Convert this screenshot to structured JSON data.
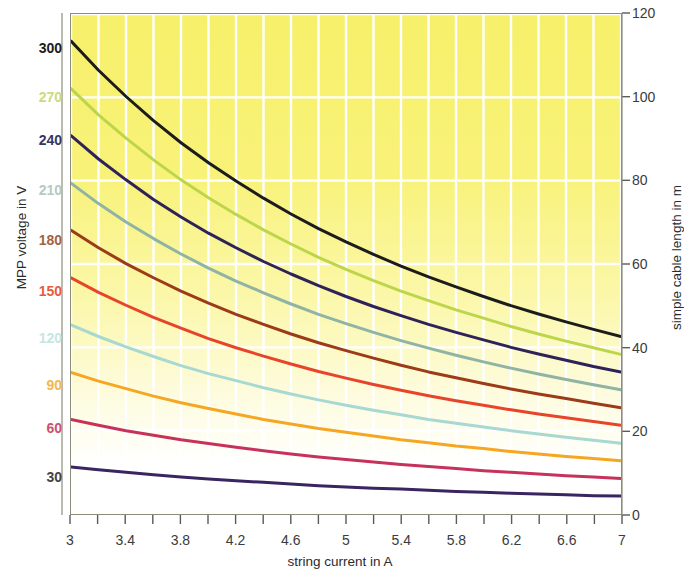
{
  "chart_data": {
    "type": "line",
    "title": "",
    "xlabel": "string current in A",
    "ylabel_left": "MPP voltage in V",
    "ylabel_right": "simple cable length in m",
    "xlim": [
      3,
      7
    ],
    "ylim_right": [
      0,
      120
    ],
    "x_ticks": [
      3,
      3.2,
      3.4,
      3.6,
      3.8,
      4.0,
      4.2,
      4.4,
      4.6,
      4.8,
      5.0,
      5.2,
      5.4,
      5.6,
      5.8,
      6.0,
      6.2,
      6.4,
      6.6,
      6.8,
      7.0
    ],
    "x_tick_labels": [
      "3",
      "",
      "3.4",
      "",
      "3.8",
      "",
      "4.2",
      "",
      "4.6",
      "",
      "5",
      "",
      "5.4",
      "",
      "5.8",
      "",
      "6.2",
      "",
      "6.6",
      "",
      "7"
    ],
    "y_right_ticks": [
      0,
      20,
      40,
      60,
      80,
      100,
      120
    ],
    "y_right_tick_labels": [
      "0",
      "20",
      "40",
      "60",
      "80",
      "100",
      "120"
    ],
    "y_left_tick_labels": [
      "300",
      "270",
      "240",
      "210",
      "180",
      "150",
      "120",
      "90",
      "60",
      "30"
    ],
    "grid": true,
    "grid_color": "#ffffff",
    "legend_position": "none",
    "background_gradient": [
      "#f7f06a",
      "#ffffff"
    ],
    "series": [
      {
        "name": "300",
        "label": "300",
        "mpp_voltage_V": 300,
        "color": "#1c1c1c",
        "cable_length_m": [
          113.5,
          106.5,
          100.2,
          94.4,
          89.1,
          84.3,
          79.9,
          75.8,
          72.0,
          68.5,
          65.3,
          62.3,
          59.5,
          56.9,
          54.5,
          52.2,
          50.0,
          48.0,
          46.1,
          44.3,
          42.6
        ]
      },
      {
        "name": "270",
        "label": "270",
        "mpp_voltage_V": 270,
        "color": "#bcd54a",
        "cable_length_m": [
          102.1,
          95.8,
          90.2,
          85.0,
          80.2,
          75.9,
          71.9,
          68.2,
          64.8,
          61.6,
          58.7,
          56.0,
          53.5,
          51.2,
          49.0,
          47.0,
          45.0,
          43.2,
          41.5,
          39.9,
          38.3
        ]
      },
      {
        "name": "240",
        "label": "240",
        "mpp_voltage_V": 240,
        "color": "#2e2358",
        "cable_length_m": [
          90.8,
          85.2,
          80.2,
          75.5,
          71.3,
          67.4,
          63.9,
          60.6,
          57.6,
          54.8,
          52.2,
          49.8,
          47.6,
          45.5,
          43.6,
          41.8,
          40.0,
          38.4,
          36.9,
          35.4,
          34.1
        ]
      },
      {
        "name": "210",
        "label": "210",
        "mpp_voltage_V": 210,
        "color": "#8fb3a4",
        "cable_length_m": [
          79.4,
          74.5,
          70.1,
          66.1,
          62.4,
          59.0,
          55.9,
          53.1,
          50.4,
          47.9,
          45.7,
          43.6,
          41.6,
          39.8,
          38.1,
          36.5,
          35.0,
          33.6,
          32.3,
          31.0,
          29.8
        ]
      },
      {
        "name": "180",
        "label": "180",
        "mpp_voltage_V": 180,
        "color": "#9c3b18",
        "cable_length_m": [
          68.1,
          63.9,
          60.1,
          56.7,
          53.5,
          50.6,
          47.9,
          45.5,
          43.2,
          41.1,
          39.2,
          37.4,
          35.7,
          34.1,
          32.7,
          31.3,
          30.0,
          28.8,
          27.7,
          26.6,
          25.5
        ]
      },
      {
        "name": "150",
        "label": "150",
        "mpp_voltage_V": 150,
        "color": "#e8442a",
        "cable_length_m": [
          56.7,
          53.2,
          50.1,
          47.2,
          44.6,
          42.1,
          39.9,
          37.9,
          36.0,
          34.2,
          32.6,
          31.1,
          29.7,
          28.4,
          27.2,
          26.1,
          25.0,
          24.0,
          23.1,
          22.2,
          21.3
        ]
      },
      {
        "name": "120",
        "label": "120",
        "mpp_voltage_V": 120,
        "color": "#a7d8d2",
        "cable_length_m": [
          45.4,
          42.6,
          40.1,
          37.8,
          35.6,
          33.7,
          32.0,
          30.3,
          28.8,
          27.4,
          26.1,
          24.9,
          23.8,
          22.7,
          21.8,
          20.9,
          20.0,
          19.2,
          18.4,
          17.7,
          17.0
        ]
      },
      {
        "name": "90",
        "label": "90",
        "mpp_voltage_V": 90,
        "color": "#f5a623",
        "cable_length_m": [
          34.0,
          31.9,
          30.1,
          28.3,
          26.7,
          25.3,
          24.0,
          22.7,
          21.6,
          20.5,
          19.6,
          18.7,
          17.8,
          17.1,
          16.3,
          15.7,
          15.0,
          14.4,
          13.8,
          13.3,
          12.8
        ]
      },
      {
        "name": "60",
        "label": "60",
        "mpp_voltage_V": 60,
        "color": "#c7325c",
        "cable_length_m": [
          22.7,
          21.3,
          20.0,
          18.9,
          17.8,
          16.9,
          16.0,
          15.2,
          14.4,
          13.7,
          13.1,
          12.5,
          11.9,
          11.4,
          10.9,
          10.4,
          10.0,
          9.6,
          9.2,
          8.9,
          8.5
        ]
      },
      {
        "name": "30",
        "label": "30",
        "mpp_voltage_V": 30,
        "color": "#3a2560",
        "cable_length_m": [
          11.3,
          10.6,
          10.0,
          9.4,
          8.9,
          8.4,
          8.0,
          7.6,
          7.2,
          6.8,
          6.5,
          6.2,
          6.0,
          5.7,
          5.4,
          5.2,
          5.0,
          4.8,
          4.6,
          4.4,
          4.3
        ]
      }
    ]
  },
  "axes": {
    "left": {
      "title": "MPP voltage in V",
      "ticks": [
        {
          "label": "300",
          "color": "#1c1c1c"
        },
        {
          "label": "270",
          "color": "#c9dc7e"
        },
        {
          "label": "240",
          "color": "#3a3560"
        },
        {
          "label": "210",
          "color": "#b4cac2"
        },
        {
          "label": "180",
          "color": "#a5613f"
        },
        {
          "label": "150",
          "color": "#ea5a3c"
        },
        {
          "label": "120",
          "color": "#c5e6e2"
        },
        {
          "label": "90",
          "color": "#f5b74b"
        },
        {
          "label": "60",
          "color": "#cc5070"
        },
        {
          "label": "30",
          "color": "#4b4040"
        }
      ]
    },
    "right": {
      "title": "simple cable length in m",
      "ticks": [
        "120",
        "100",
        "80",
        "60",
        "40",
        "20",
        "0"
      ]
    },
    "bottom": {
      "title": "string current in A",
      "ticks": [
        "3",
        "3.4",
        "3.8",
        "4.2",
        "4.6",
        "5",
        "5.4",
        "5.8",
        "6.2",
        "6.6",
        "7"
      ]
    }
  }
}
